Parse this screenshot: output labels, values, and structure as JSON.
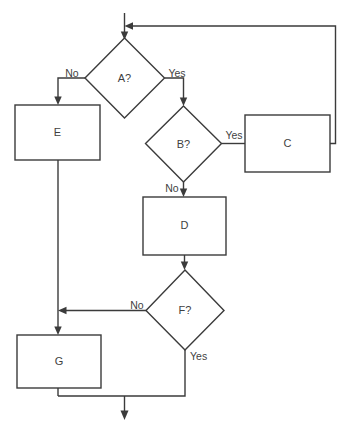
{
  "diagram": {
    "type": "flowchart",
    "title": "",
    "background_color": "#ffffff",
    "stroke_color": "#3b3b3b",
    "text_color": "#3f3f3f",
    "nodes": [
      {
        "id": "A",
        "label": "A?",
        "shape": "decision",
        "cx": 124.5,
        "cy": 78,
        "rx": 40,
        "ry": 40
      },
      {
        "id": "B",
        "label": "B?",
        "shape": "decision",
        "cx": 183.5,
        "cy": 144,
        "rx": 38,
        "ry": 38
      },
      {
        "id": "F",
        "label": "F?",
        "shape": "decision",
        "cx": 185,
        "cy": 310,
        "rx": 39,
        "ry": 40
      },
      {
        "id": "E",
        "label": "E",
        "shape": "process",
        "x": 15,
        "y": 105,
        "w": 85,
        "h": 55
      },
      {
        "id": "C",
        "label": "C",
        "shape": "process",
        "x": 245,
        "y": 115,
        "w": 85,
        "h": 57
      },
      {
        "id": "D",
        "label": "D",
        "shape": "process",
        "x": 143,
        "y": 197,
        "w": 83,
        "h": 58
      },
      {
        "id": "G",
        "label": "G",
        "shape": "process",
        "x": 17,
        "y": 335,
        "w": 84,
        "h": 53
      }
    ],
    "edge_labels": [
      {
        "id": "a-no",
        "text": "No",
        "x": 72,
        "y": 74,
        "anchor": "middle"
      },
      {
        "id": "a-yes",
        "text": "Yes",
        "x": 177,
        "y": 74,
        "anchor": "middle"
      },
      {
        "id": "b-yes",
        "text": "Yes",
        "x": 234,
        "y": 136,
        "anchor": "middle"
      },
      {
        "id": "b-no",
        "text": "No",
        "x": 172,
        "y": 189,
        "anchor": "middle"
      },
      {
        "id": "f-no",
        "text": "No",
        "x": 137,
        "y": 306,
        "anchor": "middle"
      },
      {
        "id": "f-yes",
        "text": "Yes",
        "x": 196,
        "y": 357,
        "anchor": "start"
      }
    ],
    "edges": [
      {
        "id": "start-to-a",
        "from": "start",
        "to": "A",
        "label": ""
      },
      {
        "id": "a-no-to-e",
        "from": "A",
        "to": "E",
        "label": "No"
      },
      {
        "id": "a-yes-to-b",
        "from": "A",
        "to": "B",
        "label": "Yes"
      },
      {
        "id": "b-yes-to-c",
        "from": "B",
        "to": "C",
        "label": "Yes"
      },
      {
        "id": "c-to-a",
        "from": "C",
        "to": "A",
        "label": ""
      },
      {
        "id": "b-no-to-d",
        "from": "B",
        "to": "D",
        "label": "No"
      },
      {
        "id": "d-to-f",
        "from": "D",
        "to": "F",
        "label": ""
      },
      {
        "id": "f-no-to-g",
        "from": "F",
        "to": "G",
        "label": "No"
      },
      {
        "id": "e-to-g",
        "from": "E",
        "to": "G",
        "label": ""
      },
      {
        "id": "f-yes-to-end",
        "from": "F",
        "to": "end",
        "label": "Yes"
      },
      {
        "id": "g-to-end",
        "from": "G",
        "to": "end",
        "label": ""
      }
    ]
  }
}
